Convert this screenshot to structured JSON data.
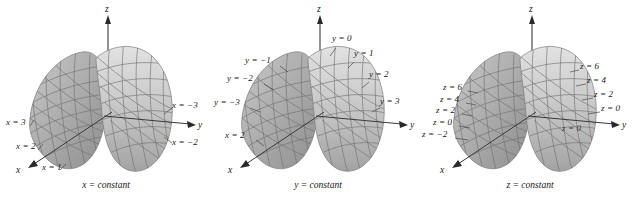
{
  "figure": {
    "background_color": "#ffffff",
    "surface_fill_light": "#d9d9d9",
    "surface_fill_mid": "#b8b8b8",
    "surface_fill_dark": "#9a9a9a",
    "mesh_color": "#6b6b6b",
    "axis_color": "#2a2a2a",
    "leader_color": "#444444",
    "text_color": "#1a1a1a"
  },
  "panels": [
    {
      "id": "panel-x-constant",
      "caption": "x = constant",
      "axes": [
        {
          "name": "z-axis-label",
          "text": "z"
        },
        {
          "name": "y-axis-label",
          "text": "y"
        },
        {
          "name": "x-axis-label",
          "text": "x"
        }
      ],
      "curve_labels": [
        {
          "name": "label-x-3",
          "text": "x = 3",
          "x": 6,
          "y": 118
        },
        {
          "name": "label-x-2",
          "text": "x = 2",
          "x": 16,
          "y": 142
        },
        {
          "name": "label-x-1",
          "text": "x = 1",
          "x": 42,
          "y": 163
        },
        {
          "name": "label-x-neg3",
          "text": "x = −3",
          "x": 172,
          "y": 105
        },
        {
          "name": "label-x-neg2",
          "text": "x = −2",
          "x": 172,
          "y": 140
        }
      ]
    },
    {
      "id": "panel-y-constant",
      "caption": "y = constant",
      "axes": [
        {
          "name": "z-axis-label",
          "text": "z"
        },
        {
          "name": "y-axis-label",
          "text": "y"
        },
        {
          "name": "x-axis-label",
          "text": "x"
        }
      ],
      "curve_labels": [
        {
          "name": "label-y-0",
          "text": "y = 0",
          "x": 120,
          "y": 38
        },
        {
          "name": "label-y-1",
          "text": "y = 1",
          "x": 142,
          "y": 53
        },
        {
          "name": "label-y-2",
          "text": "y = 2",
          "x": 157,
          "y": 73
        },
        {
          "name": "label-y-3",
          "text": "y = 3",
          "x": 168,
          "y": 100
        },
        {
          "name": "label-y-neg1",
          "text": "y = −1",
          "x": 35,
          "y": 58
        },
        {
          "name": "label-y-neg2",
          "text": "y = −2",
          "x": 17,
          "y": 76
        },
        {
          "name": "label-y-neg3",
          "text": "y = −3",
          "x": 3,
          "y": 100
        },
        {
          "name": "label-x-2",
          "text": "x = 2",
          "x": 14,
          "y": 133
        }
      ]
    },
    {
      "id": "panel-z-constant",
      "caption": "z = constant",
      "axes": [
        {
          "name": "z-axis-label",
          "text": "z"
        },
        {
          "name": "y-axis-label",
          "text": "y"
        },
        {
          "name": "x-axis-label",
          "text": "x"
        }
      ],
      "curve_labels": [
        {
          "name": "label-z-6-right",
          "text": "z = 6",
          "x": 156,
          "y": 65
        },
        {
          "name": "label-z-4-right",
          "text": "z = 4",
          "x": 163,
          "y": 79
        },
        {
          "name": "label-z-2-right",
          "text": "z = 2",
          "x": 170,
          "y": 93
        },
        {
          "name": "label-z-0-right",
          "text": "z = 0",
          "x": 177,
          "y": 107
        },
        {
          "name": "label-z-6-left",
          "text": "z = 6",
          "x": 20,
          "y": 86
        },
        {
          "name": "label-z-4-left",
          "text": "z = 4",
          "x": 17,
          "y": 98
        },
        {
          "name": "label-z-2-left",
          "text": "z = 2",
          "x": 13,
          "y": 109
        },
        {
          "name": "label-z-0-left",
          "text": "z = 0",
          "x": 10,
          "y": 121
        },
        {
          "name": "label-z-neg2-left",
          "text": "z = −2",
          "x": 0,
          "y": 133
        },
        {
          "name": "label-z-0-surface",
          "text": "z = 0",
          "x": 140,
          "y": 128
        }
      ]
    }
  ]
}
